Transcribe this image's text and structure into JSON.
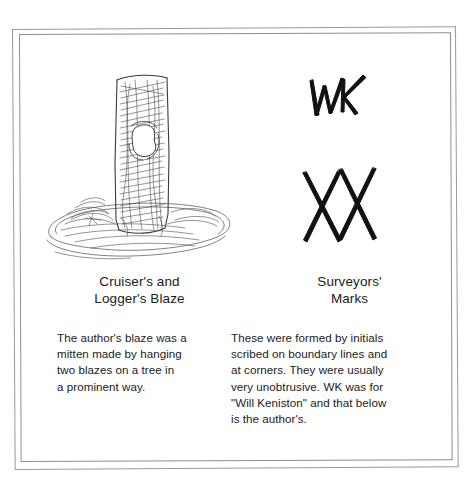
{
  "figure": {
    "background_color": "#ffffff",
    "frame": {
      "name": "double-rule-border",
      "outer_color": "#9a9a9a",
      "inner_color": "#8e8e8e"
    },
    "columns": {
      "left": {
        "artwork": {
          "icon_name": "blazed-tree-sketch",
          "description": "pencil sketch of a tree trunk with a mitten-shaped blaze",
          "ink_color": "#3b3b3b"
        },
        "caption": {
          "lines": [
            "Cruiser's and",
            "Logger's Blaze"
          ]
        },
        "body": {
          "lines": [
            "The author's blaze was a",
            "mitten made by hanging",
            "two blazes on a tree in",
            "a prominent way."
          ]
        }
      },
      "right": {
        "artwork_top": {
          "icon_name": "wk-monogram-mark",
          "description": "hand-drawn WK initials",
          "ink_color": "#111111"
        },
        "artwork_bottom": {
          "icon_name": "double-x-mark",
          "description": "two overlapping hand-drawn X strokes",
          "ink_color": "#111111"
        },
        "caption": {
          "lines": [
            "Surveyors'",
            "Marks"
          ]
        },
        "body": {
          "lines": [
            "These were formed by initials",
            "scribed on boundary lines and",
            "at corners. They were usually",
            "very unobtrusive. WK was for",
            "\"Will Keniston\" and that below",
            "is the author's."
          ]
        }
      }
    }
  }
}
